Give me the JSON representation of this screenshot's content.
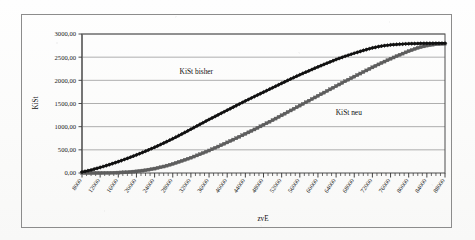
{
  "chart_data": {
    "type": "line",
    "title": "",
    "xlabel": "zvE",
    "ylabel": "KiSt",
    "xlim": [
      8000,
      88000
    ],
    "ylim": [
      0,
      3000
    ],
    "grid": true,
    "legend_position": "inline-annotation",
    "x_tick_labels": [
      "8000",
      "12000",
      "16000",
      "20000",
      "24000",
      "28000",
      "32000",
      "36000",
      "40000",
      "44000",
      "48000",
      "52000",
      "56000",
      "60000",
      "64000",
      "68000",
      "72000",
      "76000",
      "80000",
      "84000",
      "88000"
    ],
    "y_tick_labels": [
      "0,00",
      "500,00",
      "1000,00",
      "1500,00",
      "2000,00",
      "2500,00",
      "3000,00"
    ],
    "y_tick_values": [
      0,
      500,
      1000,
      1500,
      2000,
      2500,
      3000
    ],
    "x_minor_tick_step": 1000,
    "series": [
      {
        "name": "KiSt bisher",
        "color": "#111111",
        "marker": "diamond",
        "annotation": "KiSt bisher",
        "x": [
          8000,
          10000,
          12000,
          14000,
          16000,
          18000,
          20000,
          22000,
          24000,
          26000,
          28000,
          30000,
          32000,
          34000,
          36000,
          38000,
          40000,
          42000,
          44000,
          46000,
          48000,
          50000,
          52000,
          54000,
          56000,
          58000,
          60000,
          62000,
          64000,
          66000,
          68000,
          70000,
          72000,
          74000,
          76000,
          78000,
          80000,
          82000,
          84000,
          86000,
          88000
        ],
        "values": [
          20,
          65,
          120,
          180,
          245,
          315,
          390,
          470,
          555,
          645,
          740,
          840,
          945,
          1050,
          1155,
          1255,
          1355,
          1455,
          1555,
          1650,
          1745,
          1840,
          1935,
          2030,
          2120,
          2205,
          2290,
          2370,
          2450,
          2520,
          2585,
          2645,
          2700,
          2740,
          2765,
          2780,
          2790,
          2795,
          2798,
          2800,
          2800
        ]
      },
      {
        "name": "KiSt neu",
        "color": "#5e5e5e",
        "marker": "square",
        "annotation": "KiSt neu",
        "x": [
          8000,
          10000,
          12000,
          14000,
          16000,
          18000,
          20000,
          22000,
          24000,
          26000,
          28000,
          30000,
          32000,
          34000,
          36000,
          38000,
          40000,
          42000,
          44000,
          46000,
          48000,
          50000,
          52000,
          54000,
          56000,
          58000,
          60000,
          62000,
          64000,
          66000,
          68000,
          70000,
          72000,
          74000,
          76000,
          78000,
          80000,
          82000,
          84000,
          86000,
          88000
        ],
        "values": [
          0,
          0,
          0,
          2,
          8,
          18,
          35,
          60,
          95,
          140,
          195,
          260,
          330,
          405,
          485,
          570,
          660,
          750,
          845,
          940,
          1040,
          1140,
          1245,
          1350,
          1455,
          1560,
          1665,
          1770,
          1875,
          1980,
          2080,
          2180,
          2280,
          2375,
          2465,
          2550,
          2630,
          2700,
          2750,
          2780,
          2790
        ]
      }
    ],
    "annotations": [
      {
        "text": "KiSt bisher",
        "x_frac": 0.315,
        "y_frac": 0.285
      },
      {
        "text": "KiSt neu",
        "x_frac": 0.735,
        "y_frac": 0.585
      }
    ]
  },
  "colors": {
    "frame": "#8c8c8c",
    "plot_border": "#4d4d4d",
    "grid": "#9a9a9a",
    "series_bisher": "#111111",
    "series_neu": "#5e5e5e",
    "background": "#fdfdfc"
  }
}
